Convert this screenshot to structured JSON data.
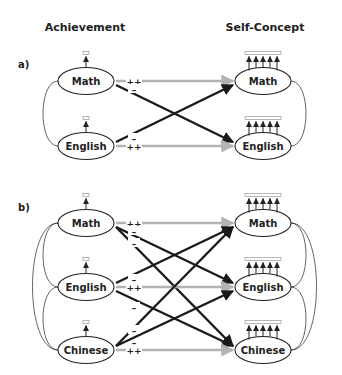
{
  "headers": {
    "left": "Achievement",
    "right": "Self-Concept"
  },
  "panels": [
    {
      "label": "a)",
      "left_nodes": [
        "Math",
        "English"
      ],
      "right_nodes": [
        "Math",
        "English"
      ],
      "left_indicators": 1,
      "right_indicators": 5,
      "paths": [
        {
          "from": "Math",
          "to": "Math",
          "sign": "++",
          "style": "gray"
        },
        {
          "from": "Math",
          "to": "English",
          "sign": "–",
          "style": "black"
        },
        {
          "from": "English",
          "to": "Math",
          "sign": "–",
          "style": "black"
        },
        {
          "from": "English",
          "to": "English",
          "sign": "++",
          "style": "gray"
        }
      ]
    },
    {
      "label": "b)",
      "left_nodes": [
        "Math",
        "English",
        "Chinese"
      ],
      "right_nodes": [
        "Math",
        "English",
        "Chinese"
      ],
      "left_indicators": 1,
      "right_indicators": 5,
      "paths": [
        {
          "from": "Math",
          "to": "Math",
          "sign": "++",
          "style": "gray"
        },
        {
          "from": "Math",
          "to": "English",
          "sign": "–",
          "style": "black"
        },
        {
          "from": "Math",
          "to": "Chinese",
          "sign": "–",
          "style": "black"
        },
        {
          "from": "English",
          "to": "Math",
          "sign": "–",
          "style": "black"
        },
        {
          "from": "English",
          "to": "English",
          "sign": "++",
          "style": "gray"
        },
        {
          "from": "English",
          "to": "Chinese",
          "sign": "–",
          "style": "black"
        },
        {
          "from": "Chinese",
          "to": "Math",
          "sign": "–",
          "style": "black"
        },
        {
          "from": "Chinese",
          "to": "English",
          "sign": "–",
          "style": "black"
        },
        {
          "from": "Chinese",
          "to": "Chinese",
          "sign": "++",
          "style": "gray"
        }
      ]
    }
  ],
  "colors": {
    "positive_path": "#b3b3b3",
    "negative_path": "#1a1a1a",
    "stroke": "#222222"
  }
}
